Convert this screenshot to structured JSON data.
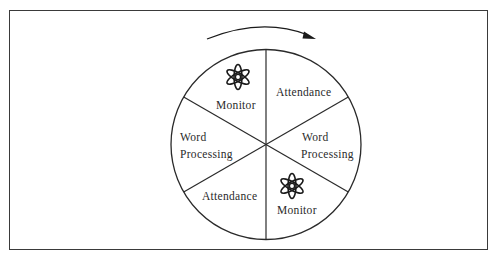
{
  "figure": {
    "rotation_direction": "clockwise",
    "colors": {
      "stroke": "#2a2a2a",
      "frame": "#3a3a3a",
      "background": "#ffffff"
    },
    "sectors": [
      {
        "position": "top-left",
        "label": "Monitor",
        "icon": "atom-icon"
      },
      {
        "position": "top-right",
        "label": "Attendance"
      },
      {
        "position": "right",
        "label_line1": "Word",
        "label_line2": "Processing"
      },
      {
        "position": "bottom-right",
        "label": "Monitor",
        "icon": "atom-icon"
      },
      {
        "position": "bottom-left",
        "label": "Attendance"
      },
      {
        "position": "left",
        "label_line1": "Word",
        "label_line2": "Processing"
      }
    ]
  }
}
